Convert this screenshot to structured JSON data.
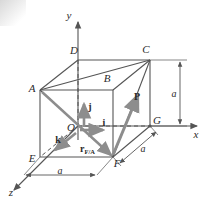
{
  "figure": {
    "background_color": "#ffffff",
    "line_color": "#555555",
    "vector_color": "#8d8d8d",
    "text_color": "#2b2b2b"
  },
  "axes": {
    "x_label": "x",
    "y_label": "y",
    "z_label": "z"
  },
  "vertices": {
    "A": "A",
    "B": "B",
    "C": "C",
    "D": "D",
    "E": "E",
    "F": "F",
    "G": "G",
    "O": "O"
  },
  "vectors": {
    "i_label": "i",
    "j_label": "j",
    "k_label": "k",
    "P_label": "P",
    "r_label": "r",
    "r_subscript": "F/A"
  },
  "dimensions": {
    "bottom_a": "a",
    "depth_a": "a",
    "vertical_a": "a"
  }
}
